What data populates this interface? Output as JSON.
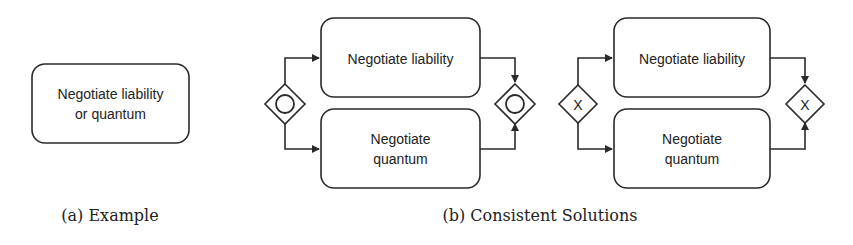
{
  "panel_a": {
    "task": {
      "line1": "Negotiate liability",
      "line2": "or quantum"
    },
    "caption": "(a) Example"
  },
  "panel_b": {
    "solution_parallel": {
      "gateway_type": "inclusive-or",
      "top_task": "Negotiate liability",
      "bottom_task": {
        "line1": "Negotiate",
        "line2": "quantum"
      }
    },
    "solution_exclusive": {
      "gateway_type": "exclusive-xor",
      "gateway_symbol": "X",
      "top_task": "Negotiate liability",
      "bottom_task": {
        "line1": "Negotiate",
        "line2": "quantum"
      }
    },
    "caption": "(b) Consistent Solutions"
  },
  "colors": {
    "stroke": "#2a2a2a",
    "text": "#222222",
    "background": "#ffffff"
  }
}
